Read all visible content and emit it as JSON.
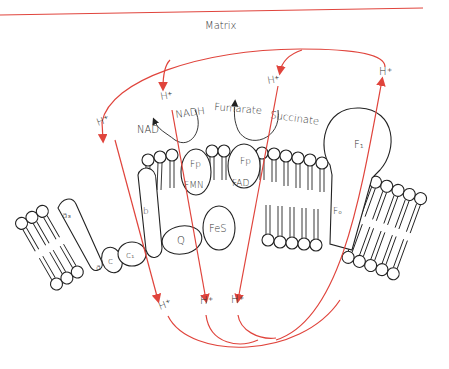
{
  "diagram": {
    "title": "Matrix",
    "colors": {
      "proton_path": "#e0443c",
      "outline": "#222222",
      "text": "#333333"
    },
    "labels": {
      "h_plus": "H⁺",
      "nad": "NAD",
      "nadh": "NADH",
      "fumarate": "Fumarate",
      "succinate": "Succinate",
      "fp": "Fp",
      "fmn": "FMN",
      "fad": "FAD",
      "fes": "FeS",
      "q": "Q",
      "b": "b",
      "c1": "c₁",
      "c": "c",
      "a": "a",
      "a3": "a₃",
      "f1": "F₁",
      "f0": "F₀"
    }
  }
}
